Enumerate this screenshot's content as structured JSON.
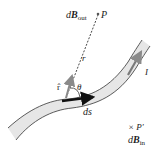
{
  "diagram": {
    "labels": {
      "dB_out_prefix": "d",
      "dB_out_symbol": "B",
      "dB_out_sub": "out",
      "point_P": "P",
      "r": "r",
      "r_hat": "r̂",
      "theta": "θ",
      "ds": "ds",
      "current": "I",
      "point_P_prime": "× P′",
      "dB_in_prefix": "d",
      "dB_in_symbol": "B",
      "dB_in_sub": "in"
    },
    "colors": {
      "wire_fill": "#e6e6e6",
      "wire_edge": "#333333",
      "ds_arrow": "#111111",
      "rhat_arrow": "#8a8a8a",
      "current_arrow": "#7a7a7a",
      "dashed_line": "#333333"
    }
  }
}
